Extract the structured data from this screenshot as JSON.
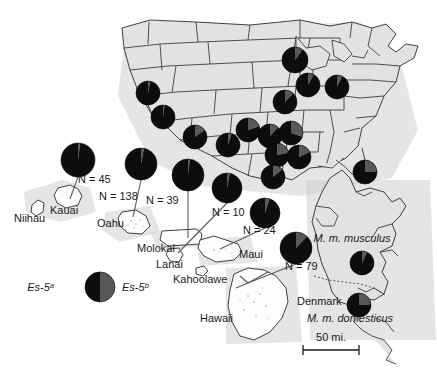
{
  "figure": {
    "scale_bar": {
      "label": "50 mi."
    },
    "legend": {
      "left_label": "Es-5",
      "left_sup": "a",
      "right_label": "Es-5",
      "right_sup": "b",
      "left_color": "#0d0d0d",
      "right_color": "#585858"
    },
    "subspecies": [
      {
        "name": "M. m. musculus",
        "x": 352,
        "y": 242
      },
      {
        "name": "M. m. domesticus",
        "x": 350,
        "y": 322
      }
    ],
    "place_labels": [
      {
        "name": "Niihau",
        "x": 14,
        "y": 222
      },
      {
        "name": "Kauai",
        "x": 50,
        "y": 214
      },
      {
        "name": "Oahu",
        "x": 97,
        "y": 227
      },
      {
        "name": "Molokai",
        "x": 137,
        "y": 252
      },
      {
        "name": "Lanai",
        "x": 156,
        "y": 268
      },
      {
        "name": "Kahoolawe",
        "x": 173,
        "y": 283
      },
      {
        "name": "Maui",
        "x": 239,
        "y": 258
      },
      {
        "name": "Hawaii",
        "x": 200,
        "y": 322
      },
      {
        "name": "Denmark",
        "x": 297,
        "y": 305
      }
    ],
    "sample_labels": [
      {
        "text": "N = 45",
        "x": 78,
        "y": 183,
        "site": "Kauai"
      },
      {
        "text": "N = 138",
        "x": 99,
        "y": 200,
        "site": "Oahu"
      },
      {
        "text": "N = 39",
        "x": 146,
        "y": 204,
        "site": "Molokai"
      },
      {
        "text": "N = 10",
        "x": 212,
        "y": 216,
        "site": "Lanai"
      },
      {
        "text": "N = 24",
        "x": 243,
        "y": 234,
        "site": "Maui"
      },
      {
        "text": "N = 79",
        "x": 285,
        "y": 270,
        "site": "Hawaii"
      }
    ]
  },
  "chart_data": {
    "type": "pie",
    "slice_names": [
      "Es-5a",
      "Es-5b"
    ],
    "slice_colors": [
      "#0d0d0d",
      "#585858"
    ],
    "ylabel": "",
    "xlabel": "",
    "legend_position": "lower-left",
    "pies": [
      {
        "id": "us-nd",
        "label": "",
        "cx": 295,
        "cy": 60,
        "r": 13,
        "es5a": 0.9,
        "es5b": 0.1,
        "n": null
      },
      {
        "id": "us-pnw",
        "label": "",
        "cx": 148,
        "cy": 93,
        "r": 12,
        "es5a": 0.97,
        "es5b": 0.03,
        "n": null
      },
      {
        "id": "us-nca",
        "label": "",
        "cx": 163,
        "cy": 117,
        "r": 12,
        "es5a": 0.98,
        "es5b": 0.02,
        "n": null
      },
      {
        "id": "us-sca",
        "label": "",
        "cx": 195,
        "cy": 137,
        "r": 12,
        "es5a": 0.85,
        "es5b": 0.15,
        "n": null
      },
      {
        "id": "us-az",
        "label": "",
        "cx": 228,
        "cy": 145,
        "r": 12,
        "es5a": 0.95,
        "es5b": 0.05,
        "n": null
      },
      {
        "id": "us-mn",
        "label": "",
        "cx": 308,
        "cy": 85,
        "r": 12,
        "es5a": 0.92,
        "es5b": 0.08,
        "n": null
      },
      {
        "id": "us-mi",
        "label": "",
        "cx": 337,
        "cy": 87,
        "r": 12,
        "es5a": 0.93,
        "es5b": 0.07,
        "n": null
      },
      {
        "id": "us-ia",
        "label": "",
        "cx": 285,
        "cy": 102,
        "r": 12,
        "es5a": 0.88,
        "es5b": 0.12,
        "n": null
      },
      {
        "id": "us-mo",
        "label": "",
        "cx": 248,
        "cy": 130,
        "r": 12,
        "es5a": 0.8,
        "es5b": 0.2,
        "n": null
      },
      {
        "id": "us-ar",
        "label": "",
        "cx": 270,
        "cy": 136,
        "r": 12,
        "es5a": 0.88,
        "es5b": 0.12,
        "n": null
      },
      {
        "id": "us-tn",
        "label": "",
        "cx": 291,
        "cy": 133,
        "r": 12,
        "es5a": 0.7,
        "es5b": 0.3,
        "n": null
      },
      {
        "id": "us-ky",
        "label": "",
        "cx": 277,
        "cy": 155,
        "r": 12,
        "es5a": 0.78,
        "es5b": 0.22,
        "n": null
      },
      {
        "id": "us-ga",
        "label": "",
        "cx": 299,
        "cy": 157,
        "r": 12,
        "es5a": 0.82,
        "es5b": 0.18,
        "n": null
      },
      {
        "id": "us-la",
        "label": "",
        "cx": 273,
        "cy": 177,
        "r": 12,
        "es5a": 0.86,
        "es5b": 0.14,
        "n": null
      },
      {
        "id": "us-fl",
        "label": "",
        "cx": 365,
        "cy": 172,
        "r": 12,
        "es5a": 0.75,
        "es5b": 0.25,
        "n": null
      },
      {
        "id": "kauai",
        "label": "N = 45",
        "cx": 78,
        "cy": 160,
        "r": 17,
        "es5a": 0.98,
        "es5b": 0.02,
        "n": 45
      },
      {
        "id": "oahu",
        "label": "N = 138",
        "cx": 141,
        "cy": 164,
        "r": 16,
        "es5a": 0.97,
        "es5b": 0.03,
        "n": 138
      },
      {
        "id": "molokai",
        "label": "N = 39",
        "cx": 188,
        "cy": 175,
        "r": 16,
        "es5a": 0.98,
        "es5b": 0.02,
        "n": 39
      },
      {
        "id": "lanai",
        "label": "N = 10",
        "cx": 227,
        "cy": 188,
        "r": 15,
        "es5a": 0.97,
        "es5b": 0.03,
        "n": 10
      },
      {
        "id": "maui",
        "label": "N = 24",
        "cx": 265,
        "cy": 213,
        "r": 15,
        "es5a": 0.95,
        "es5b": 0.05,
        "n": 24
      },
      {
        "id": "hawaii",
        "label": "N = 79",
        "cx": 296,
        "cy": 248,
        "r": 16,
        "es5a": 0.88,
        "es5b": 0.12,
        "n": 79
      },
      {
        "id": "musculus",
        "label": "M. m. musculus",
        "cx": 362,
        "cy": 263,
        "r": 12,
        "es5a": 0.93,
        "es5b": 0.07,
        "n": null
      },
      {
        "id": "domesticus",
        "label": "M. m. domesticus",
        "cx": 359,
        "cy": 305,
        "r": 12,
        "es5a": 0.76,
        "es5b": 0.24,
        "n": null
      }
    ]
  }
}
